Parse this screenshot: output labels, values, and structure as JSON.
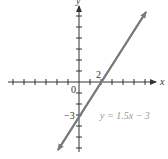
{
  "chart_data": {
    "type": "line",
    "title": "",
    "xlabel": "x",
    "ylabel": "y",
    "equation_label": "y = 1.5x − 3",
    "annotations": [
      {
        "text": "2",
        "meaning": "x-intercept",
        "x": 2,
        "y": 0
      },
      {
        "text": "−3",
        "meaning": "y-intercept",
        "x": 0,
        "y": -3
      },
      {
        "text": "0",
        "meaning": "origin",
        "x": 0,
        "y": 0
      }
    ],
    "series": [
      {
        "name": "y = 1.5x − 3",
        "slope": 1.5,
        "intercept": -3,
        "x": [
          -2,
          0,
          2,
          6
        ],
        "y": [
          -6,
          -3,
          0,
          6
        ]
      }
    ],
    "xlim": [
      -6.5,
      7
    ],
    "ylim": [
      -6,
      7
    ],
    "grid": false,
    "tick_spacing": 1,
    "colors": {
      "line": "#7a7a7a",
      "axis": "#333333"
    }
  },
  "labels": {
    "x_axis": "x",
    "y_axis": "y",
    "origin": "0",
    "x_intercept": "2",
    "y_intercept": "−3",
    "equation": "y = 1.5x − 3"
  }
}
